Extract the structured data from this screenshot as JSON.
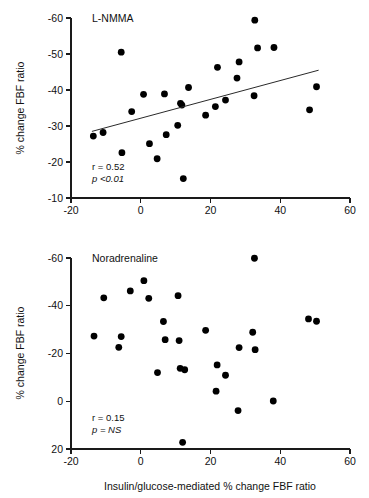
{
  "figure": {
    "xlabel": "Insulin/glucose-mediated % change FBF ratio",
    "ylabel": "% change FBF ratio"
  },
  "chart_data": [
    {
      "type": "scatter",
      "title": "L-NMMA",
      "xlabel": "",
      "ylabel": "% change FBF ratio",
      "xlim": [
        -20,
        60
      ],
      "ylim": [
        -60,
        -10
      ],
      "y_axis_inverted": true,
      "xticks": [
        -20,
        0,
        20,
        40,
        60
      ],
      "yticks": [
        -60,
        -50,
        -40,
        -30,
        -20,
        -10
      ],
      "grid": false,
      "legend": "none",
      "annotations": [
        {
          "name": "correlation",
          "text": "r = 0.52"
        },
        {
          "name": "pvalue",
          "text": "p <0.01"
        }
      ],
      "r": 0.52,
      "p": "<0.01",
      "regression_line": {
        "x0": -14.0,
        "y0": -28.5,
        "x1": 51.0,
        "y1": -45.5
      },
      "points": [
        {
          "x": -13.6,
          "y": -27.2
        },
        {
          "x": -10.8,
          "y": -28.2
        },
        {
          "x": -5.6,
          "y": -50.5
        },
        {
          "x": -5.4,
          "y": -22.6
        },
        {
          "x": -2.6,
          "y": -34.0
        },
        {
          "x": 0.8,
          "y": -38.8
        },
        {
          "x": 2.5,
          "y": -25.1
        },
        {
          "x": 4.7,
          "y": -20.9
        },
        {
          "x": 6.8,
          "y": -38.9
        },
        {
          "x": 7.3,
          "y": -27.6
        },
        {
          "x": 10.6,
          "y": -30.2
        },
        {
          "x": 11.4,
          "y": -36.3
        },
        {
          "x": 11.8,
          "y": -35.8
        },
        {
          "x": 12.2,
          "y": -15.4
        },
        {
          "x": 13.7,
          "y": -40.7
        },
        {
          "x": 18.6,
          "y": -33.0
        },
        {
          "x": 21.4,
          "y": -35.4
        },
        {
          "x": 22.0,
          "y": -46.3
        },
        {
          "x": 24.3,
          "y": -37.2
        },
        {
          "x": 27.6,
          "y": -43.3
        },
        {
          "x": 28.2,
          "y": -47.8
        },
        {
          "x": 32.5,
          "y": -38.4
        },
        {
          "x": 32.7,
          "y": -59.4
        },
        {
          "x": 33.5,
          "y": -51.7
        },
        {
          "x": 38.2,
          "y": -51.8
        },
        {
          "x": 48.4,
          "y": -34.5
        },
        {
          "x": 50.4,
          "y": -40.9
        }
      ]
    },
    {
      "type": "scatter",
      "title": "Noradrenaline",
      "xlabel": "Insulin/glucose-mediated % change FBF ratio",
      "ylabel": "% change FBF ratio",
      "xlim": [
        -20,
        60
      ],
      "ylim": [
        -60,
        20
      ],
      "y_axis_inverted": true,
      "xticks": [
        -20,
        0,
        20,
        40,
        60
      ],
      "yticks": [
        -60,
        -40,
        -20,
        0,
        20
      ],
      "grid": false,
      "legend": "none",
      "annotations": [
        {
          "name": "correlation",
          "text": "r = 0.15"
        },
        {
          "name": "pvalue",
          "text": "p = NS"
        }
      ],
      "r": 0.15,
      "p": "NS",
      "points": [
        {
          "x": -13.4,
          "y": -27.3
        },
        {
          "x": -10.6,
          "y": -43.3
        },
        {
          "x": -6.3,
          "y": -22.6
        },
        {
          "x": -5.6,
          "y": -27.1
        },
        {
          "x": -3.0,
          "y": -46.2
        },
        {
          "x": 0.9,
          "y": -50.5
        },
        {
          "x": 2.3,
          "y": -43.1
        },
        {
          "x": 4.8,
          "y": -12.0
        },
        {
          "x": 6.5,
          "y": -33.4
        },
        {
          "x": 7.0,
          "y": -25.8
        },
        {
          "x": 10.7,
          "y": -44.2
        },
        {
          "x": 11.0,
          "y": -25.4
        },
        {
          "x": 11.3,
          "y": -13.8
        },
        {
          "x": 12.0,
          "y": 17.2
        },
        {
          "x": 12.6,
          "y": -13.2
        },
        {
          "x": 18.6,
          "y": -29.7
        },
        {
          "x": 21.6,
          "y": -4.2
        },
        {
          "x": 21.9,
          "y": -15.2
        },
        {
          "x": 24.3,
          "y": -10.9
        },
        {
          "x": 27.9,
          "y": 3.9
        },
        {
          "x": 28.2,
          "y": -22.5
        },
        {
          "x": 32.1,
          "y": -28.9
        },
        {
          "x": 32.6,
          "y": -59.9
        },
        {
          "x": 32.8,
          "y": -21.6
        },
        {
          "x": 38.0,
          "y": -0.1
        },
        {
          "x": 48.1,
          "y": -34.5
        },
        {
          "x": 50.4,
          "y": -33.5
        }
      ]
    }
  ]
}
